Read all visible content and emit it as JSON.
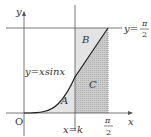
{
  "diagram": {
    "type": "function-graph-regions",
    "function_label": "y=xsinx",
    "axis_labels": {
      "x": "x",
      "y": "y",
      "origin": "O"
    },
    "horizontal_line_label": {
      "lhs": "y=",
      "num": "π",
      "den": "2"
    },
    "vertical_line_label": "x=k",
    "x_end_label": {
      "num": "π",
      "den": "2"
    },
    "regions": [
      {
        "name": "A",
        "label": "A",
        "description": "under curve, 0 ≤ x ≤ k"
      },
      {
        "name": "B",
        "label": "B",
        "description": "between curve and y=π/2, k ≤ x ≤ π/2"
      },
      {
        "name": "C",
        "label": "C",
        "description": "under curve, k ≤ x ≤ π/2"
      }
    ],
    "colors": {
      "axis": "#555555",
      "curve": "#222222",
      "light_fill": "#e6e6e6",
      "dark_fill": "#c4c4c4"
    }
  }
}
